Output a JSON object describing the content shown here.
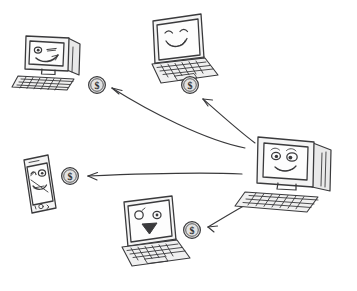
{
  "diagram": {
    "title": "Central computer distributing money to connected devices",
    "background_color": "#ffffff",
    "ink_color": "#3a3a3c",
    "style": "hand-drawn sketch"
  },
  "nodes": [
    {
      "id": "source-desktop",
      "icon": "desktop-computer-icon",
      "label": "Desktop computer with smiling face",
      "role": "source",
      "face": "smiling",
      "position": "right-center"
    },
    {
      "id": "target-desktop",
      "icon": "desktop-computer-icon",
      "label": "Desktop computer with winking face",
      "role": "recipient",
      "face": "winking",
      "position": "top-left"
    },
    {
      "id": "target-laptop-happy",
      "icon": "laptop-icon",
      "label": "Laptop with happy face",
      "role": "recipient",
      "face": "happy",
      "position": "top-center"
    },
    {
      "id": "target-phone",
      "icon": "smartphone-icon",
      "label": "Smartphone with face",
      "role": "recipient",
      "face": "neutral",
      "position": "middle-left"
    },
    {
      "id": "target-laptop-sad",
      "icon": "laptop-icon",
      "label": "Laptop with sad face",
      "role": "recipient",
      "face": "sad",
      "position": "bottom-center"
    }
  ],
  "coins": [
    {
      "id": "coin-to-desktop",
      "icon": "dollar-coin-icon",
      "symbol": "$",
      "near": "target-desktop"
    },
    {
      "id": "coin-to-laptop-happy",
      "icon": "dollar-coin-icon",
      "symbol": "$",
      "near": "target-laptop-happy"
    },
    {
      "id": "coin-to-phone",
      "icon": "dollar-coin-icon",
      "symbol": "$",
      "near": "target-phone"
    },
    {
      "id": "coin-to-laptop-sad",
      "icon": "dollar-coin-icon",
      "symbol": "$",
      "near": "target-laptop-sad"
    }
  ],
  "arrows": [
    {
      "id": "arrow-to-desktop",
      "icon": "arrow-icon",
      "from": "source-desktop",
      "to": "target-desktop",
      "direction": "up-left"
    },
    {
      "id": "arrow-to-laptop-happy",
      "icon": "arrow-icon",
      "from": "source-desktop",
      "to": "target-laptop-happy",
      "direction": "up-left"
    },
    {
      "id": "arrow-to-phone",
      "icon": "arrow-icon",
      "from": "source-desktop",
      "to": "target-phone",
      "direction": "left"
    },
    {
      "id": "arrow-to-laptop-sad",
      "icon": "arrow-icon",
      "from": "source-desktop",
      "to": "target-laptop-sad",
      "direction": "down-left"
    }
  ]
}
